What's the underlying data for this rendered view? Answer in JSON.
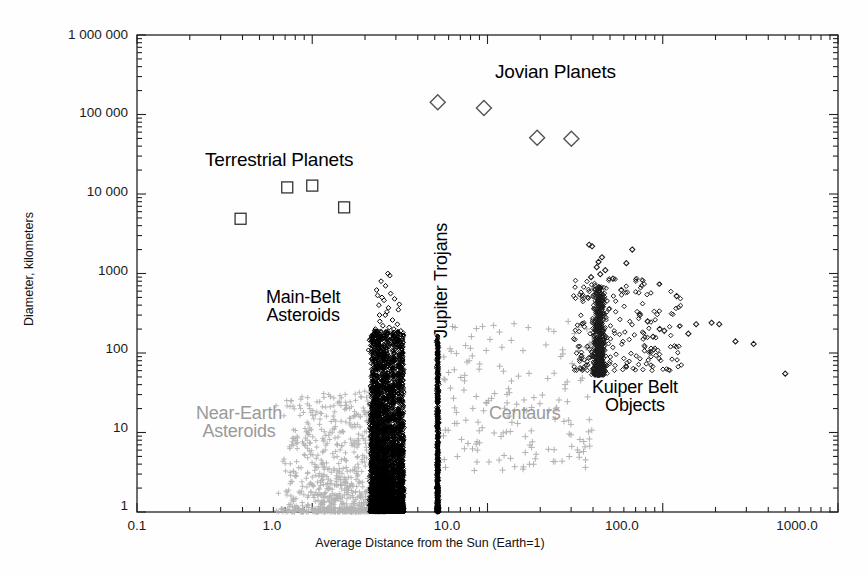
{
  "figure": {
    "title": "",
    "background": "#fefefe",
    "frame_color": "#222222"
  },
  "axes": {
    "x": {
      "title": "Average Distance from the Sun (Earth=1)",
      "scale": "log",
      "range": [
        0.1,
        1000
      ],
      "ticks": [
        "0.1",
        "1.0",
        "10.0",
        "100.0",
        "1000.0"
      ],
      "tick_values": [
        0.1,
        1,
        10,
        100,
        1000
      ]
    },
    "y": {
      "title": "Diameter, kilometers",
      "scale": "log",
      "range": [
        1,
        1000000
      ],
      "ticks": [
        "1",
        "10",
        "100",
        "1000",
        "10 000",
        "100 000",
        "1 000 000"
      ],
      "tick_values": [
        1,
        10,
        100,
        1000,
        10000,
        100000,
        1000000
      ]
    }
  },
  "annotations": [
    {
      "name": "jovian-planets-label",
      "text": "Jovian Planets",
      "color": "#000000",
      "x": 495,
      "y": 62,
      "size": 19,
      "rotated": false
    },
    {
      "name": "terrestrial-planets-label",
      "text": "Terrestrial Planets",
      "color": "#000000",
      "x": 205,
      "y": 150,
      "size": 19,
      "rotated": false
    },
    {
      "name": "main-belt-asteroids-label",
      "text": "Main-Belt\nAsteroids",
      "color": "#000000",
      "x": 266,
      "y": 288,
      "size": 18,
      "rotated": false
    },
    {
      "name": "jupiter-trojans-label",
      "text": "Jupiter Trojans",
      "color": "#000000",
      "x": 432,
      "y": 338,
      "size": 18,
      "rotated": true
    },
    {
      "name": "kuiper-belt-objects-label",
      "text": "Kuiper Belt\nObjects",
      "color": "#000000",
      "x": 592,
      "y": 378,
      "size": 18,
      "rotated": false
    },
    {
      "name": "near-earth-asteroids-label",
      "text": "Near-Earth\nAsteroids",
      "color": "#9a9a9a",
      "x": 196,
      "y": 404,
      "size": 18,
      "rotated": false
    },
    {
      "name": "centaurs-label",
      "text": "Centaurs",
      "color": "#9a9a9a",
      "x": 489,
      "y": 404,
      "size": 18,
      "rotated": false
    }
  ],
  "chart_data": {
    "type": "scatter",
    "title": "",
    "xlabel": "Average Distance from the Sun (Earth=1)",
    "ylabel": "Diameter, kilometers",
    "xscale": "log",
    "yscale": "log",
    "xlim": [
      0.1,
      1000
    ],
    "ylim": [
      1,
      1000000
    ],
    "grid": false,
    "legend": "none (in-plot text annotations)",
    "series": [
      {
        "name": "Terrestrial Planets",
        "marker": "open-square",
        "color": "#333333",
        "size": 9,
        "points": [
          {
            "label": "Mercury",
            "x": 0.39,
            "y": 4880
          },
          {
            "label": "Venus",
            "x": 0.72,
            "y": 12100
          },
          {
            "label": "Earth",
            "x": 1.0,
            "y": 12750
          },
          {
            "label": "Mars",
            "x": 1.52,
            "y": 6790
          }
        ]
      },
      {
        "name": "Jovian Planets",
        "marker": "open-diamond",
        "color": "#555555",
        "size": 11,
        "points": [
          {
            "label": "Jupiter",
            "x": 5.2,
            "y": 143000
          },
          {
            "label": "Saturn",
            "x": 9.54,
            "y": 120500
          },
          {
            "label": "Uranus",
            "x": 19.2,
            "y": 51100
          },
          {
            "label": "Neptune",
            "x": 30.1,
            "y": 49500
          }
        ]
      },
      {
        "name": "Near-Earth Asteroids",
        "marker": "plus",
        "color": "#b4b4b4",
        "size": 4,
        "count": 900,
        "x_range": [
          0.55,
          2.6
        ],
        "y_range": [
          1,
          35
        ],
        "description": "Dense gray plus-symbol cloud between 0.6 and 2.5 AU, diameters 1-35 km, densest near 1.2-2.2 AU at small sizes."
      },
      {
        "name": "Main-Belt Asteroids",
        "marker": "open-diamond",
        "color": "#000000",
        "size": 4,
        "count": 4200,
        "x_range": [
          2.0,
          3.6
        ],
        "y_range": [
          1,
          950
        ],
        "description": "Very dense black band from 2.1 to 3.4 AU reaching up to ~950 km (Ceres); bulk between 1 and 200 km."
      },
      {
        "name": "Jupiter Trojans",
        "marker": "open-diamond",
        "color": "#000000",
        "size": 4,
        "count": 700,
        "x_range": [
          5.0,
          5.35
        ],
        "y_range": [
          1,
          220
        ],
        "description": "Narrow vertical black column at 5.2 AU, diameters 1 to ~220 km."
      },
      {
        "name": "Centaurs",
        "marker": "plus",
        "color": "#b0b0b0",
        "size": 5,
        "count": 170,
        "x_range": [
          5.5,
          40
        ],
        "y_range": [
          3,
          300
        ],
        "description": "Sparse gray plus markers scattered between 6 and 35 AU, diameters 4 to 250 km."
      },
      {
        "name": "Kuiper Belt Objects",
        "marker": "open-diamond",
        "color": "#1a1a1a",
        "size": 5,
        "count": 900,
        "x_range": [
          30,
          520
        ],
        "y_range": [
          30,
          2300
        ],
        "description": "Dense clump at 39-48 AU with diameters 60-800 km, a few up to 2300 km (Eris/Pluto), plus scattered outliers to 520 AU."
      }
    ]
  }
}
